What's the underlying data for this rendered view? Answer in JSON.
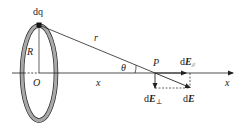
{
  "diagram": {
    "labels": {
      "charge_element": "dq",
      "radius": "R",
      "origin": "O",
      "distance_r": "r",
      "axis_distance": "x",
      "angle": "θ",
      "point": "P",
      "axis_label": "x",
      "field_parallel_d": "d",
      "field_parallel_E": "E",
      "field_parallel_sub": "//",
      "field_perp_d": "d",
      "field_perp_E": "E",
      "field_perp_sub": "⊥",
      "field_total_d": "d",
      "field_total_E": "E"
    },
    "colors": {
      "line": "#222222",
      "ring_fill": "#a8a8a8",
      "background": "#ffffff"
    }
  }
}
